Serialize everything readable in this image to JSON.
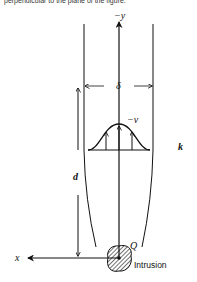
{
  "caption": "perpendicular to the plane of the figure.",
  "diagram": {
    "axis_labels": {
      "y_axis": "−y",
      "x_axis": "x"
    },
    "dimension_labels": {
      "width": "δ",
      "distance": "d"
    },
    "velocity_label": "−v",
    "conductivity_label": "k",
    "point_label": "Q",
    "intrusion_label": "Intrusion",
    "colors": {
      "stroke": "#111111",
      "background": "#ffffff"
    }
  }
}
